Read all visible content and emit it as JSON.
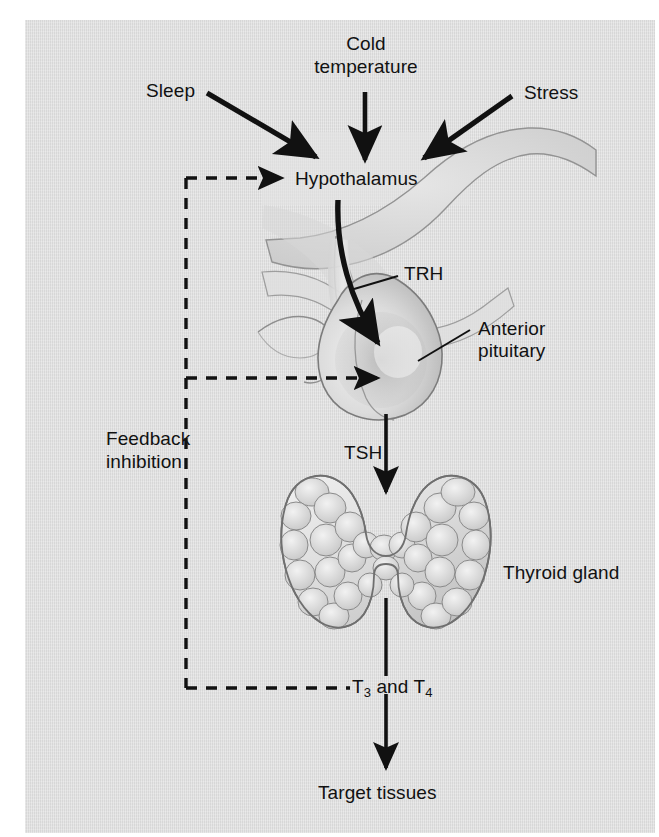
{
  "figure": {
    "background_color": "#dddddd",
    "page_color": "#ffffff",
    "text_color": "#111111"
  },
  "labels": {
    "sleep": "Sleep",
    "cold_line1": "Cold",
    "cold_line2": "temperature",
    "stress": "Stress",
    "hypothalamus": "Hypothalamus",
    "trh": "TRH",
    "anterior_line1": "Anterior",
    "anterior_line2": "pituitary",
    "tsh": "TSH",
    "thyroid_gland": "Thyroid gland",
    "feedback_line1": "Feedback",
    "feedback_line2": "inhibition",
    "t3_and_t4_prefix": "T",
    "t3_sub": "3",
    "t3_and_t4_mid": " and T",
    "t4_sub": "4",
    "target_tissues": "Target tissues"
  },
  "structures": [
    {
      "name": "hypothalamus",
      "label": "Hypothalamus"
    },
    {
      "name": "anterior-pituitary",
      "label": "Anterior pituitary"
    },
    {
      "name": "thyroid-gland",
      "label": "Thyroid gland"
    },
    {
      "name": "target-tissues",
      "label": "Target tissues"
    }
  ],
  "stimuli": [
    {
      "name": "sleep",
      "label": "Sleep"
    },
    {
      "name": "cold-temperature",
      "label": "Cold temperature"
    },
    {
      "name": "stress",
      "label": "Stress"
    }
  ],
  "hormones": [
    {
      "name": "trh",
      "label": "TRH",
      "from": "hypothalamus",
      "to": "anterior-pituitary"
    },
    {
      "name": "tsh",
      "label": "TSH",
      "from": "anterior-pituitary",
      "to": "thyroid-gland"
    },
    {
      "name": "t3-t4",
      "label": "T3 and T4",
      "from": "thyroid-gland",
      "to": "target-tissues"
    }
  ],
  "feedback": {
    "label_line1": "Feedback",
    "label_line2": "inhibition",
    "targets": [
      "hypothalamus",
      "anterior-pituitary"
    ],
    "style": "dashed"
  }
}
